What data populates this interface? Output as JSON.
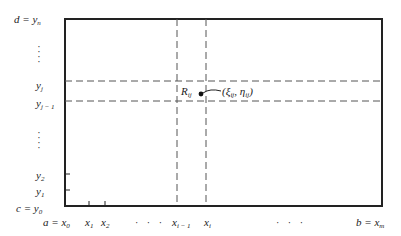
{
  "diagram": {
    "type": "rectangular-partition-grid",
    "frame": {
      "left": 65,
      "top": 19,
      "right": 382,
      "bottom": 206,
      "stroke": "#222222"
    },
    "dashed_color": "#555555",
    "y_labels": [
      {
        "id": "d",
        "prefix": "d = y",
        "sub": "n"
      },
      {
        "id": "yj",
        "prefix": "y",
        "sub": "j"
      },
      {
        "id": "yj1",
        "prefix": "y",
        "sub": "j − 1"
      },
      {
        "id": "y2",
        "prefix": "y",
        "sub": "2"
      },
      {
        "id": "y1",
        "prefix": "y",
        "sub": "1"
      },
      {
        "id": "c",
        "prefix": "c = y",
        "sub": "0"
      }
    ],
    "x_labels": [
      {
        "id": "a",
        "prefix": "a = x",
        "sub": "0"
      },
      {
        "id": "x1",
        "prefix": "x",
        "sub": "1"
      },
      {
        "id": "x2",
        "prefix": "x",
        "sub": "2"
      },
      {
        "id": "xi1",
        "prefix": "x",
        "sub": "i − 1"
      },
      {
        "id": "xi",
        "prefix": "x",
        "sub": "i"
      },
      {
        "id": "b",
        "prefix": "b = x",
        "sub": "m"
      }
    ],
    "ellipsis": "· · ·",
    "region": {
      "label": "R",
      "sub": "ij"
    },
    "point": {
      "open": "(ξ",
      "sub1": "ij",
      "mid": ", η",
      "sub2": "ij",
      "close": ")"
    }
  }
}
